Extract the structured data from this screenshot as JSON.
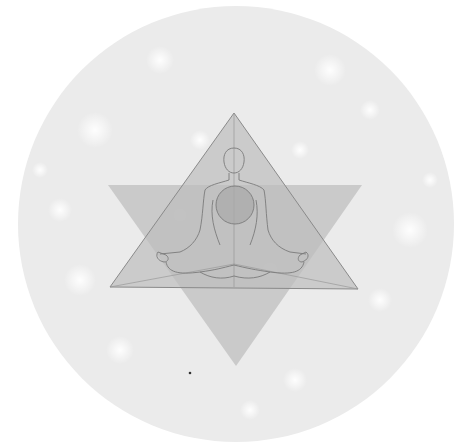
{
  "illustration": {
    "subject": "meditating figure inside six-pointed star on sparkly circle",
    "colors": {
      "background": "#ffffff",
      "circle": "#ebebeb",
      "triangle_up": "#bdbdbd",
      "triangle_down": "#c4c4c4",
      "outline": "#8a8a8a",
      "heart": "#a9a9a9",
      "sparkle": "#ffffff"
    },
    "circle": {
      "cx": 236,
      "cy": 224,
      "r": 218
    },
    "triangle_up": {
      "points": "234,113 110,287 358,289"
    },
    "triangle_down": {
      "points": "108,185 362,185 236,366"
    },
    "heart_circle": {
      "cx": 235,
      "cy": 205,
      "r": 19
    },
    "dot": {
      "cx": 190,
      "cy": 373,
      "r": 1.3
    }
  }
}
